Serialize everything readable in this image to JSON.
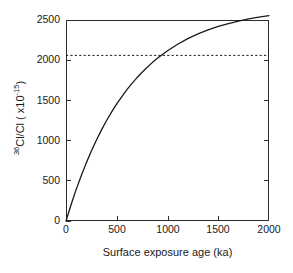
{
  "chart_data": {
    "type": "line",
    "title": "",
    "xlabel": "Surface exposure age (ka)",
    "ylabel_parts": {
      "isotope_superscript": "36",
      "isotope_body": "Cl/Cl ( x10",
      "exponent": "-15",
      "close": ")"
    },
    "ylabel_plain": "36Cl/Cl ( x10-15)",
    "xlim": [
      0,
      2000
    ],
    "ylim": [
      0,
      2500
    ],
    "xticks": [
      0,
      500,
      1000,
      1500,
      2000
    ],
    "xticklabels": [
      "0",
      "500",
      "1000",
      "1500",
      "2000"
    ],
    "yticks": [
      0,
      500,
      1000,
      1500,
      2000,
      2500
    ],
    "yticklabels": [
      "0",
      "500",
      "1000",
      "1500",
      "2000",
      "2500"
    ],
    "grid": false,
    "legend": false,
    "series": [
      {
        "name": "36Cl/Cl build-up curve",
        "style": "solid",
        "color": "#1a1a1a",
        "x": [
          0,
          25,
          50,
          75,
          100,
          150,
          200,
          250,
          300,
          350,
          400,
          450,
          500,
          550,
          600,
          650,
          700,
          750,
          800,
          850,
          900,
          950,
          1000,
          1100,
          1200,
          1300,
          1400,
          1500,
          1600,
          1700,
          1800,
          1900,
          2000
        ],
        "y": [
          0,
          103,
          202,
          298,
          390,
          563,
          723,
          871,
          1007,
          1133,
          1250,
          1357,
          1457,
          1548,
          1633,
          1711,
          1784,
          1851,
          1913,
          1970,
          2023,
          2072,
          2118,
          2199,
          2268,
          2327,
          2377,
          2420,
          2456,
          2487,
          2513,
          2536,
          2555
        ]
      }
    ],
    "annotations": [
      {
        "name": "secular-equilibrium-asymptote",
        "style": "dotted",
        "orientation": "horizontal",
        "y_value": 2060,
        "color": "#1a1a1a"
      }
    ]
  },
  "axis": {
    "x_tick_label_0": "0",
    "x_tick_label_1": "500",
    "x_tick_label_2": "1000",
    "x_tick_label_3": "1500",
    "x_tick_label_4": "2000",
    "y_tick_label_0": "0",
    "y_tick_label_1": "500",
    "y_tick_label_2": "1000",
    "y_tick_label_3": "1500",
    "y_tick_label_4": "2000",
    "y_tick_label_5": "2500"
  }
}
